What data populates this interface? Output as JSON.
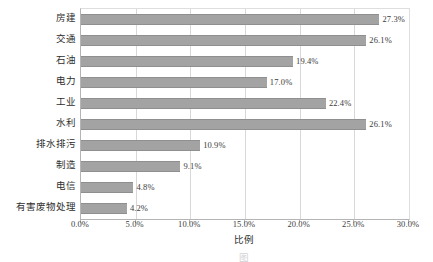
{
  "chart_data": {
    "type": "bar",
    "orientation": "horizontal",
    "title": "",
    "xlabel": "比例",
    "ylabel": "",
    "xlim": [
      0,
      30
    ],
    "xtick_labels": [
      "0.0%",
      "5.0%",
      "10.0%",
      "15.0%",
      "20.0%",
      "25.0%",
      "30.0%"
    ],
    "xtick_values": [
      0,
      5,
      10,
      15,
      20,
      25,
      30
    ],
    "grid": true,
    "legend": false,
    "bar_color": "#a3a3a3",
    "categories": [
      "房建",
      "交通",
      "石油",
      "电力",
      "工业",
      "水利",
      "排水排污",
      "制造",
      "电信",
      "有害废物处理"
    ],
    "values": [
      27.3,
      26.1,
      19.4,
      17.0,
      22.4,
      26.1,
      10.9,
      9.1,
      4.8,
      4.2
    ],
    "data_labels": [
      "27.3%",
      "26.1%",
      "19.4%",
      "17.0%",
      "22.4%",
      "26.1%",
      "10.9%",
      "9.1%",
      "4.8%",
      "4.2%"
    ]
  },
  "caption": "图",
  "axis": {
    "x_title": "比例"
  }
}
